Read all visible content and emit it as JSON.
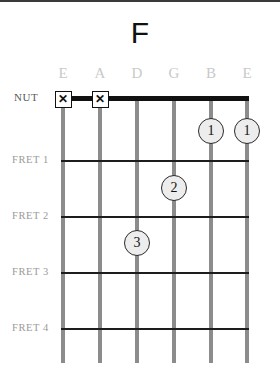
{
  "diagram": {
    "type": "guitar-chord-diagram",
    "title": "F",
    "nut_label": "NUT",
    "strings": [
      {
        "label": "E",
        "x": 63
      },
      {
        "label": "A",
        "x": 100
      },
      {
        "label": "D",
        "x": 137
      },
      {
        "label": "G",
        "x": 174
      },
      {
        "label": "B",
        "x": 211
      },
      {
        "label": "E",
        "x": 247
      }
    ],
    "frets": [
      {
        "label": "FRET 1",
        "y": 158
      },
      {
        "label": "FRET 2",
        "y": 214
      },
      {
        "label": "FRET 3",
        "y": 270
      },
      {
        "label": "FRET 4",
        "y": 326
      }
    ],
    "muted_markers": [
      {
        "glyph": "✕",
        "string": "E",
        "x": 63,
        "y": 97
      },
      {
        "glyph": "✕",
        "string": "A",
        "x": 100,
        "y": 97
      }
    ],
    "finger_positions": [
      {
        "finger": "1",
        "string": "B",
        "fret": 1,
        "x": 211,
        "y": 129
      },
      {
        "finger": "1",
        "string": "E",
        "fret": 1,
        "x": 247,
        "y": 129
      },
      {
        "finger": "2",
        "string": "G",
        "fret": 2,
        "x": 174,
        "y": 186
      },
      {
        "finger": "3",
        "string": "D",
        "fret": 3,
        "x": 137,
        "y": 241
      }
    ],
    "colors": {
      "nut": "#111111",
      "fret": "#1d1d1d",
      "string": "#8c8c8c",
      "string_label": "#c9c9c9",
      "fret_label": "#9a9a9a",
      "dot_fill": "#ededed",
      "dot_border": "#2a2a2a"
    }
  }
}
